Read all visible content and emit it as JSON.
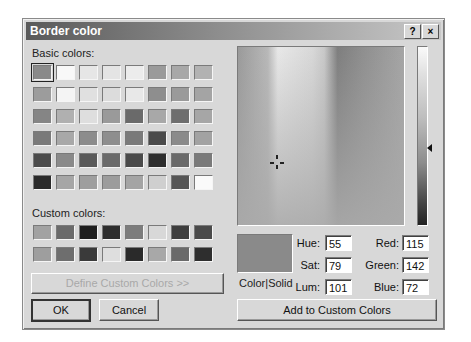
{
  "dialog": {
    "title": "Border color",
    "help_label": "?",
    "close_label": "×"
  },
  "basic_colors": {
    "label": "Basic colors:",
    "selected_index": 0,
    "swatches": [
      "#8a8a8a",
      "#f8f8f8",
      "#e6e6e6",
      "#e4e4e4",
      "#ececec",
      "#9a9a9a",
      "#a8a8a8",
      "#b2b2b2",
      "#9c9c9c",
      "#f4f4f4",
      "#e0e0e0",
      "#dcdcdc",
      "#e8e8e8",
      "#8e8e8e",
      "#9a9a9a",
      "#a4a4a4",
      "#858585",
      "#b0b0b0",
      "#dedede",
      "#9a9a9a",
      "#6a6a6a",
      "#a8a8a8",
      "#6e6e6e",
      "#a6a6a6",
      "#7a7a7a",
      "#a8a8a8",
      "#8c8c8c",
      "#8e8e8e",
      "#7a7a7a",
      "#4a4a4a",
      "#8a8a8a",
      "#a2a2a2",
      "#4c4c4c",
      "#8a8a8a",
      "#5a5a5a",
      "#6a6a6a",
      "#4a4a4a",
      "#2e2e2e",
      "#6a6a6a",
      "#7a7a7a",
      "#2a2a2a",
      "#a6a6a6",
      "#9e9e9e",
      "#9c9c9c",
      "#a4a4a4",
      "#cfcfcf",
      "#565656",
      "#fafafa"
    ]
  },
  "custom_colors": {
    "label": "Custom colors:",
    "swatches": [
      "#a2a2a2",
      "#6a6a6a",
      "#1e1e1e",
      "#2e2e2e",
      "#7c7c7c",
      "#d8d8d8",
      "#3e3e3e",
      "#4a4a4a",
      "#9e9e9e",
      "#6e6e6e",
      "#3a3a3a",
      "#dedede",
      "#2a2a2a",
      "#a8a8a8",
      "#6a6a6a",
      "#2e2e2e"
    ]
  },
  "buttons": {
    "define_custom": "Define Custom Colors >>",
    "ok": "OK",
    "cancel": "Cancel",
    "add_custom": "Add to Custom Colors"
  },
  "color_solid": {
    "label": "Color|Solid",
    "color": "#8a8a8a"
  },
  "hsl": {
    "hue_label": "Hue:",
    "hue": "55",
    "sat_label": "Sat:",
    "sat": "79",
    "lum_label": "Lum:",
    "lum": "101"
  },
  "rgb": {
    "red_label": "Red:",
    "red": "115",
    "green_label": "Green:",
    "green": "142",
    "blue_label": "Blue:",
    "blue": "72"
  }
}
